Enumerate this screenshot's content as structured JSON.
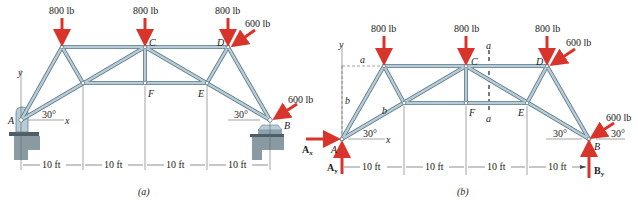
{
  "figure_a": {
    "caption": "(a)",
    "loads": [
      {
        "label": "800 lb",
        "joint": "top-left"
      },
      {
        "label": "800 lb",
        "joint": "C"
      },
      {
        "label": "800 lb",
        "joint": "D"
      },
      {
        "label": "600 lb",
        "joint": "D",
        "direction": "inclined"
      },
      {
        "label": "600 lb",
        "joint": "B",
        "direction": "inclined"
      }
    ],
    "joints": {
      "A": "A",
      "B": "B",
      "C": "C",
      "D": "D",
      "E": "E",
      "F": "F"
    },
    "angles": [
      "30°",
      "30°"
    ],
    "axes": {
      "x": "x",
      "y": "y"
    },
    "dimensions": [
      "10 ft",
      "10 ft",
      "10 ft",
      "10 ft"
    ]
  },
  "figure_b": {
    "caption": "(b)",
    "loads": [
      {
        "label": "800 lb",
        "joint": "top-left"
      },
      {
        "label": "800 lb",
        "joint": "C"
      },
      {
        "label": "800 lb",
        "joint": "D"
      },
      {
        "label": "600 lb",
        "joint": "D",
        "direction": "inclined"
      },
      {
        "label": "600 lb",
        "joint": "B",
        "direction": "inclined"
      }
    ],
    "joints": {
      "A": "A",
      "B": "B",
      "C": "C",
      "D": "D",
      "E": "E",
      "F": "F"
    },
    "reactions": {
      "Ax": "A",
      "Ax_sub": "x",
      "Ay": "A",
      "Ay_sub": "y",
      "By": "B",
      "By_sub": "y"
    },
    "section_labels": {
      "a_top": "a",
      "a_bottom": "a",
      "a_dim": "a",
      "b_dim": "b",
      "b_member": "b"
    },
    "angles": [
      "30°",
      "30°",
      "30°"
    ],
    "axes": {
      "x": "x",
      "y": "y"
    },
    "dimensions": [
      "10 ft",
      "10 ft",
      "10 ft",
      "10 ft"
    ]
  },
  "colors": {
    "member_fill": "#b9ccd6",
    "member_edge": "#5f7d8c",
    "load_arrow": "#d9342b",
    "text": "#222222"
  }
}
